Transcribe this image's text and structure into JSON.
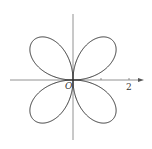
{
  "chart_data": {
    "type": "line",
    "title": "",
    "equation": "r = 2 sin(2θ)",
    "amplitude": 2,
    "petals": 4,
    "xlabel": "",
    "ylabel": "",
    "x_ticks": [
      1,
      2
    ],
    "tick_labels": {
      "origin": "O",
      "x2": "2"
    },
    "grid": false,
    "legend": null,
    "colors": {
      "curve": "#333333",
      "axis": "#777777"
    }
  },
  "layout": {
    "origin_px": [
      73,
      80
    ],
    "unit_px": 28
  }
}
